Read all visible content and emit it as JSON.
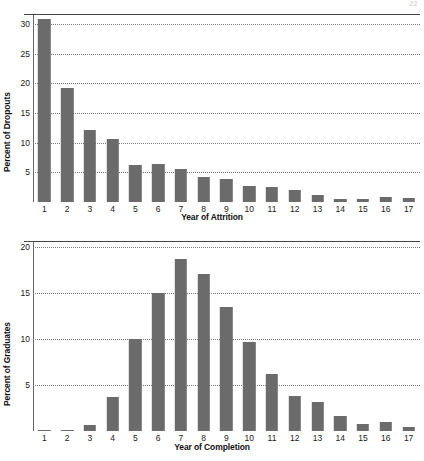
{
  "page": {
    "page_number": "22"
  },
  "charts": [
    {
      "id": "attrition",
      "ylabel": "Percent of Dropouts",
      "xlabel": "Year of Attrition",
      "yticks": [
        5,
        10,
        15,
        20,
        25,
        30
      ],
      "ymax": 31.7,
      "xticks": [
        "1",
        "2",
        "3",
        "4",
        "5",
        "6",
        "7",
        "8",
        "9",
        "10",
        "11",
        "12",
        "13",
        "14",
        "15",
        "16",
        "17"
      ]
    },
    {
      "id": "completion",
      "ylabel": "Percent of Graduates",
      "xlabel": "Year of Completion",
      "yticks": [
        5,
        10,
        15,
        20
      ],
      "ymax": 20.6,
      "xticks": [
        "1",
        "2",
        "3",
        "4",
        "5",
        "6",
        "7",
        "8",
        "9",
        "10",
        "11",
        "12",
        "13",
        "14",
        "15",
        "16",
        "17"
      ]
    }
  ],
  "chart_data": [
    {
      "type": "bar",
      "id": "attrition",
      "title": "",
      "xlabel": "Year of Attrition",
      "ylabel": "Percent of Dropouts",
      "categories": [
        "1",
        "2",
        "3",
        "4",
        "5",
        "6",
        "7",
        "8",
        "9",
        "10",
        "11",
        "12",
        "13",
        "14",
        "15",
        "16",
        "17"
      ],
      "values": [
        30.8,
        19.3,
        12.2,
        10.7,
        6.3,
        6.4,
        5.5,
        4.3,
        3.9,
        2.7,
        2.5,
        2.0,
        1.2,
        0.5,
        0.5,
        0.8,
        0.6
      ],
      "ylim": [
        0,
        31.7
      ],
      "yticks": [
        5,
        10,
        15,
        20,
        25,
        30
      ],
      "grid": "horizontal-dotted",
      "legend": "none",
      "bar_color": "#6b6b6b"
    },
    {
      "type": "bar",
      "id": "completion",
      "title": "",
      "xlabel": "Year of Completion",
      "ylabel": "Percent of Graduates",
      "categories": [
        "1",
        "2",
        "3",
        "4",
        "5",
        "6",
        "7",
        "8",
        "9",
        "10",
        "11",
        "12",
        "13",
        "14",
        "15",
        "16",
        "17"
      ],
      "values": [
        0.1,
        0.1,
        0.7,
        3.7,
        10.0,
        15.0,
        18.6,
        17.0,
        13.4,
        9.6,
        6.2,
        3.8,
        3.1,
        1.6,
        0.8,
        1.0,
        0.4
      ],
      "ylim": [
        0,
        20.6
      ],
      "yticks": [
        5,
        10,
        15,
        20
      ],
      "grid": "horizontal-dotted",
      "legend": "none",
      "bar_color": "#6b6b6b"
    }
  ]
}
